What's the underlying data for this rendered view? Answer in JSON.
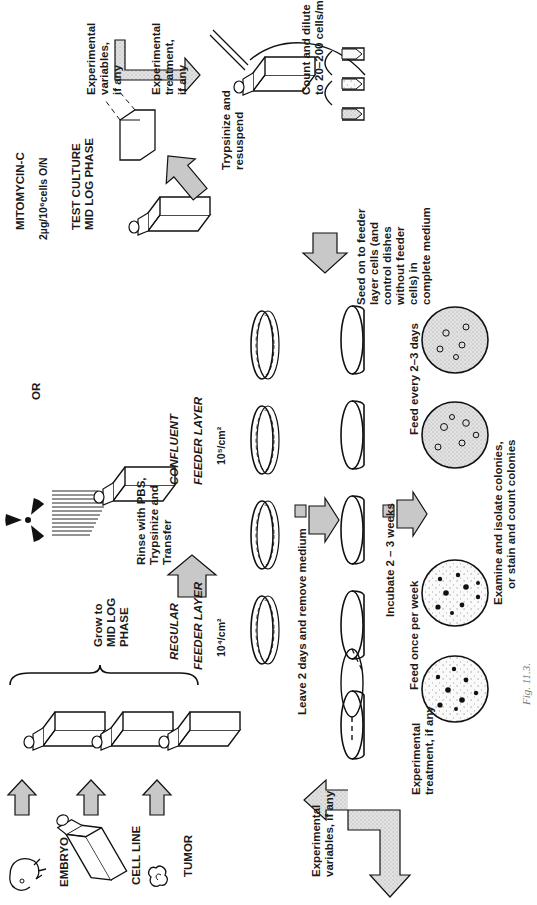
{
  "figure": {
    "orientation": "rotated 90 degrees (text reads bottom-to-top)",
    "sources": {
      "embryo": "EMBRYO",
      "cell_line": "CELL LINE",
      "tumor": "TUMOR"
    },
    "grow_label": "Grow to\nMID LOG\nPHASE",
    "irradiation": {
      "or_label": "OR",
      "mitomycin_label": "MITOMYCIN-C",
      "mitomycin_dose": "2µg/10⁶cells O/N"
    },
    "rinse_label": "Rinse with PBS,\nTrypsinize and\nTransfer",
    "feeder_layers": {
      "regular_title": "REGULAR",
      "regular_sub": "FEEDER LAYER",
      "regular_density": "10⁴/cm²",
      "confluent_title": "CONFLUENT",
      "confluent_sub": "FEEDER LAYER",
      "confluent_density": "10⁵/cm²"
    },
    "leave_label": "Leave 2 days and remove medium",
    "incubate_label": "Incubate 2 – 3 weeks",
    "feed_weekly_label": "Feed once per week",
    "feed_2_3_label": "Feed every 2–3 days",
    "examine_label": "Examine and isolate colonies,\n     or stain and count colonies",
    "exp_left": {
      "variables": "Experimental\nvariables, if any",
      "treatment": "Experimental\ntreatment, if any"
    },
    "test_culture": {
      "title": "TEST CULTURE\nMID LOG PHASE",
      "trypsinize": "Trypsinize and\nresuspend",
      "count_dilute": "Count and dilute\nto 20–200 cells/ml",
      "seed_label": "Seed on to feeder\nlayer cells (and\ncontrol dishes\nwithout feeder\ncells) in\ncomplete medium"
    },
    "exp_right": {
      "variables": "Experimental\nvariables,\nif any",
      "treatment": "Experimental\ntreatment,\nif any"
    },
    "caption": "Fig. 11.3."
  },
  "colors": {
    "arrow_fill": "#c8c8c8",
    "ink": "#111111",
    "stipple": "#cfcfcf"
  }
}
